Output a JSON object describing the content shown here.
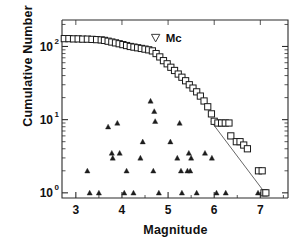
{
  "chart_data": {
    "type": "scatter",
    "title": "",
    "xlabel": "Magnitude",
    "ylabel": "Cumulative Number",
    "xlim": [
      2.7,
      7.6
    ],
    "ylim": [
      0.85,
      230
    ],
    "yscale": "log",
    "grid": false,
    "legend": null,
    "xticks": [
      3,
      4,
      5,
      6,
      7
    ],
    "xticklabels": [
      "3",
      "4",
      "5",
      "6",
      "7"
    ],
    "yticks": [
      1,
      10,
      100
    ],
    "yticklabels": [
      "10",
      "10",
      "10"
    ],
    "yticklabel_exponents": [
      "0",
      "1",
      "2"
    ],
    "annotations": [
      {
        "label": "Mc",
        "marker": "open-down-triangle",
        "x": 4.73,
        "y": 130,
        "label_x": 4.95,
        "label_y": 130
      }
    ],
    "series": [
      {
        "name": "cumulative-number",
        "marker": "open-square",
        "points": [
          [
            2.75,
            128
          ],
          [
            2.85,
            128
          ],
          [
            2.95,
            127
          ],
          [
            3.05,
            127
          ],
          [
            3.15,
            126
          ],
          [
            3.25,
            126
          ],
          [
            3.35,
            125
          ],
          [
            3.45,
            124
          ],
          [
            3.55,
            123
          ],
          [
            3.62,
            121
          ],
          [
            3.7,
            118
          ],
          [
            3.78,
            115
          ],
          [
            3.86,
            112
          ],
          [
            3.94,
            109
          ],
          [
            4.02,
            106
          ],
          [
            4.1,
            103
          ],
          [
            4.18,
            100
          ],
          [
            4.26,
            98
          ],
          [
            4.34,
            96
          ],
          [
            4.42,
            94
          ],
          [
            4.5,
            92
          ],
          [
            4.58,
            90
          ],
          [
            4.66,
            87
          ],
          [
            4.74,
            80
          ],
          [
            4.82,
            72
          ],
          [
            4.9,
            64
          ],
          [
            4.98,
            58
          ],
          [
            5.06,
            52
          ],
          [
            5.14,
            47
          ],
          [
            5.22,
            42
          ],
          [
            5.3,
            38
          ],
          [
            5.38,
            34
          ],
          [
            5.46,
            30
          ],
          [
            5.54,
            27
          ],
          [
            5.62,
            24
          ],
          [
            5.7,
            21
          ],
          [
            5.78,
            18
          ],
          [
            5.86,
            15
          ],
          [
            5.94,
            12
          ],
          [
            6.0,
            9.5
          ],
          [
            6.08,
            9.0
          ],
          [
            6.16,
            9.0
          ],
          [
            6.24,
            9.0
          ],
          [
            6.32,
            9.0
          ],
          [
            6.36,
            6.0
          ],
          [
            6.48,
            5.0
          ],
          [
            6.56,
            5.0
          ],
          [
            6.64,
            4.5
          ],
          [
            6.72,
            4.0
          ],
          [
            6.96,
            2.0
          ],
          [
            7.04,
            2.0
          ],
          [
            7.08,
            1.0
          ],
          [
            7.12,
            1.0
          ]
        ]
      },
      {
        "name": "incremental-number",
        "marker": "filled-triangle",
        "points": [
          [
            3.25,
            2.0
          ],
          [
            3.3,
            1.0
          ],
          [
            3.5,
            1.0
          ],
          [
            3.7,
            8.0
          ],
          [
            3.78,
            3.5
          ],
          [
            3.9,
            9.0
          ],
          [
            3.95,
            3.5
          ],
          [
            3.8,
            3.0
          ],
          [
            4.05,
            1.0
          ],
          [
            4.1,
            2.0
          ],
          [
            4.25,
            1.0
          ],
          [
            4.45,
            5.0
          ],
          [
            4.4,
            3.0
          ],
          [
            4.62,
            18.0
          ],
          [
            4.7,
            13.0
          ],
          [
            4.72,
            9.5
          ],
          [
            4.68,
            2.0
          ],
          [
            4.8,
            1.0
          ],
          [
            5.05,
            5.0
          ],
          [
            5.25,
            9.0
          ],
          [
            5.2,
            3.0
          ],
          [
            5.28,
            2.0
          ],
          [
            5.3,
            1.0
          ],
          [
            5.45,
            3.5
          ],
          [
            5.42,
            2.0
          ],
          [
            5.5,
            3.0
          ],
          [
            5.48,
            2.0
          ],
          [
            5.62,
            1.0
          ],
          [
            5.8,
            3.5
          ],
          [
            5.95,
            3.0
          ],
          [
            6.05,
            1.0
          ],
          [
            6.25,
            1.0
          ],
          [
            6.95,
            1.0
          ]
        ]
      }
    ],
    "fit_line": {
      "name": "gutenberg-richter-fit",
      "start": [
        5.93,
        9.5
      ],
      "end": [
        7.1,
        1.0
      ],
      "style": "solid"
    }
  }
}
